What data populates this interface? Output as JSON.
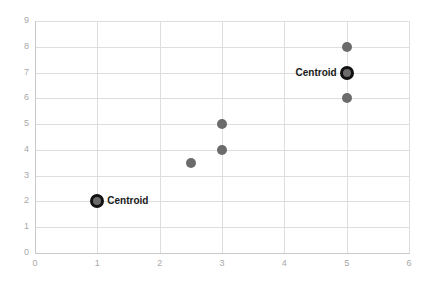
{
  "chart_data": {
    "type": "scatter",
    "title": "",
    "xlabel": "",
    "ylabel": "",
    "xlim": [
      0,
      6
    ],
    "ylim": [
      0,
      9
    ],
    "xticks": [
      0,
      1,
      2,
      3,
      4,
      5,
      6
    ],
    "yticks": [
      0,
      1,
      2,
      3,
      4,
      5,
      6,
      7,
      8,
      9
    ],
    "grid": true,
    "legend": "none",
    "series": [
      {
        "name": "data-points",
        "marker": "circle",
        "color": "#6b6b6b",
        "points": [
          {
            "x": 2.5,
            "y": 3.5
          },
          {
            "x": 3,
            "y": 4
          },
          {
            "x": 3,
            "y": 5
          },
          {
            "x": 5,
            "y": 6
          },
          {
            "x": 5,
            "y": 7
          },
          {
            "x": 5,
            "y": 8
          },
          {
            "x": 1,
            "y": 2
          }
        ]
      },
      {
        "name": "centroids",
        "marker": "circle",
        "color": "#111111",
        "points": [
          {
            "x": 1,
            "y": 2,
            "label": "Centroid",
            "label_side": "right"
          },
          {
            "x": 5,
            "y": 7,
            "label": "Centroid",
            "label_side": "left"
          }
        ]
      }
    ],
    "annotations": [
      {
        "text": "Centroid",
        "x": 1,
        "y": 2
      },
      {
        "text": "Centroid",
        "x": 5,
        "y": 7
      }
    ]
  }
}
